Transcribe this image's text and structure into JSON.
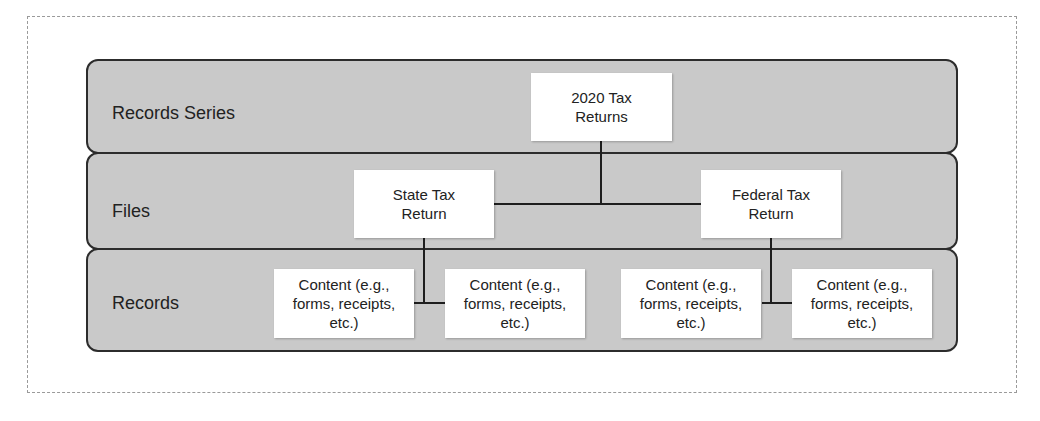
{
  "diagram": {
    "levels": [
      {
        "label": "Records Series"
      },
      {
        "label": "Files"
      },
      {
        "label": "Records"
      }
    ],
    "nodes": {
      "root": {
        "label": "2020 Tax\nReturns"
      },
      "state": {
        "label": "State Tax\nReturn"
      },
      "federal": {
        "label": "Federal Tax\nReturn"
      },
      "content_1": {
        "label": "Content (e.g.,\nforms, receipts,\netc.)"
      },
      "content_2": {
        "label": "Content (e.g.,\nforms, receipts,\netc.)"
      },
      "content_3": {
        "label": "Content (e.g.,\nforms, receipts,\netc.)"
      },
      "content_4": {
        "label": "Content (e.g.,\nforms, receipts,\netc.)"
      }
    },
    "edges": [
      {
        "from": "root",
        "to": "state"
      },
      {
        "from": "root",
        "to": "federal"
      },
      {
        "from": "state",
        "to": "content_1"
      },
      {
        "from": "state",
        "to": "content_2"
      },
      {
        "from": "federal",
        "to": "content_3"
      },
      {
        "from": "federal",
        "to": "content_4"
      }
    ],
    "colors": {
      "band_fill": "#c9c9c9",
      "band_border": "#2c2c2c",
      "node_fill": "#ffffff",
      "connector": "#1e1e1e"
    }
  }
}
